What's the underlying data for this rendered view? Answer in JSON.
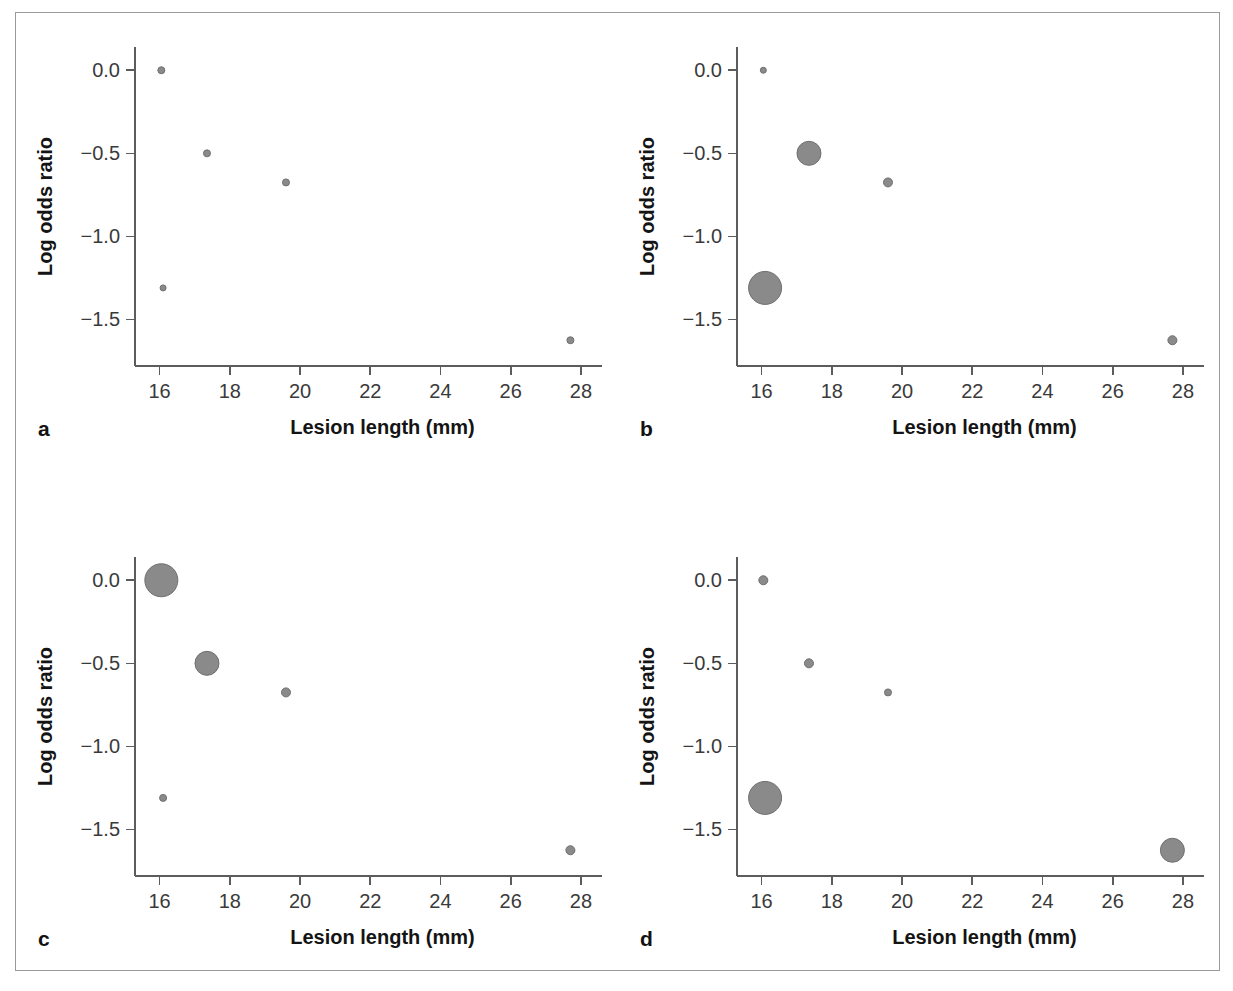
{
  "figure": {
    "panel_letters": [
      "a",
      "b",
      "c",
      "d"
    ],
    "marker_color": "#8a8a8a",
    "marker_stroke_color": "#6f6f6f",
    "axis_color": "#5c5c5c",
    "frame_color": "#9a9a9a"
  },
  "chart_data": [
    {
      "type": "scatter",
      "panel": "a",
      "title": "",
      "xlabel": "Lesion length (mm)",
      "ylabel": "Log odds ratio",
      "xlim": [
        15.3,
        28.6
      ],
      "ylim": [
        -1.78,
        0.14
      ],
      "xticks": [
        16,
        18,
        20,
        22,
        24,
        26,
        28
      ],
      "xticklabels": [
        "16",
        "18",
        "20",
        "22",
        "24",
        "26",
        "28"
      ],
      "yticks": [
        0.0,
        -0.5,
        -1.0,
        -1.5
      ],
      "yticklabels": [
        "0.0",
        "-0.5",
        "-1.0",
        "-1.5"
      ],
      "grid": false,
      "legend": "none",
      "points": [
        {
          "x": 16.05,
          "y": 0.0,
          "size": 7
        },
        {
          "x": 17.35,
          "y": -0.5,
          "size": 7
        },
        {
          "x": 19.6,
          "y": -0.675,
          "size": 7
        },
        {
          "x": 16.1,
          "y": -1.31,
          "size": 6
        },
        {
          "x": 27.7,
          "y": -1.625,
          "size": 7
        }
      ]
    },
    {
      "type": "scatter",
      "panel": "b",
      "title": "",
      "xlabel": "Lesion length (mm)",
      "ylabel": "Log odds ratio",
      "xlim": [
        15.3,
        28.6
      ],
      "ylim": [
        -1.78,
        0.14
      ],
      "xticks": [
        16,
        18,
        20,
        22,
        24,
        26,
        28
      ],
      "xticklabels": [
        "16",
        "18",
        "20",
        "22",
        "24",
        "26",
        "28"
      ],
      "yticks": [
        0.0,
        -0.5,
        -1.0,
        -1.5
      ],
      "yticklabels": [
        "0.0",
        "-0.5",
        "-1.0",
        "-1.5"
      ],
      "grid": false,
      "legend": "none",
      "points": [
        {
          "x": 16.05,
          "y": 0.0,
          "size": 6
        },
        {
          "x": 17.35,
          "y": -0.5,
          "size": 24
        },
        {
          "x": 19.6,
          "y": -0.675,
          "size": 9
        },
        {
          "x": 16.1,
          "y": -1.31,
          "size": 33
        },
        {
          "x": 27.7,
          "y": -1.625,
          "size": 9
        }
      ]
    },
    {
      "type": "scatter",
      "panel": "c",
      "title": "",
      "xlabel": "Lesion length (mm)",
      "ylabel": "Log odds ratio",
      "xlim": [
        15.3,
        28.6
      ],
      "ylim": [
        -1.78,
        0.14
      ],
      "xticks": [
        16,
        18,
        20,
        22,
        24,
        26,
        28
      ],
      "xticklabels": [
        "16",
        "18",
        "20",
        "22",
        "24",
        "26",
        "28"
      ],
      "yticks": [
        0.0,
        -0.5,
        -1.0,
        -1.5
      ],
      "yticklabels": [
        "0.0",
        "-0.5",
        "-1.0",
        "-1.5"
      ],
      "grid": false,
      "legend": "none",
      "points": [
        {
          "x": 16.05,
          "y": 0.0,
          "size": 33
        },
        {
          "x": 17.35,
          "y": -0.5,
          "size": 24
        },
        {
          "x": 19.6,
          "y": -0.675,
          "size": 9
        },
        {
          "x": 16.1,
          "y": -1.31,
          "size": 7
        },
        {
          "x": 27.7,
          "y": -1.625,
          "size": 9
        }
      ]
    },
    {
      "type": "scatter",
      "panel": "d",
      "title": "",
      "xlabel": "Lesion length (mm)",
      "ylabel": "Log odds ratio",
      "xlim": [
        15.3,
        28.6
      ],
      "ylim": [
        -1.78,
        0.14
      ],
      "xticks": [
        16,
        18,
        20,
        22,
        24,
        26,
        28
      ],
      "xticklabels": [
        "16",
        "18",
        "20",
        "22",
        "24",
        "26",
        "28"
      ],
      "yticks": [
        0.0,
        -0.5,
        -1.0,
        -1.5
      ],
      "yticklabels": [
        "0.0",
        "-0.5",
        "-1.0",
        "-1.5"
      ],
      "grid": false,
      "legend": "none",
      "points": [
        {
          "x": 16.05,
          "y": 0.0,
          "size": 9
        },
        {
          "x": 17.35,
          "y": -0.5,
          "size": 9
        },
        {
          "x": 19.6,
          "y": -0.675,
          "size": 7
        },
        {
          "x": 16.1,
          "y": -1.31,
          "size": 33
        },
        {
          "x": 27.7,
          "y": -1.625,
          "size": 24
        }
      ]
    }
  ]
}
